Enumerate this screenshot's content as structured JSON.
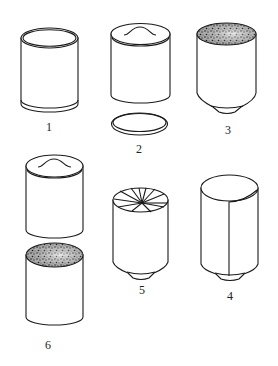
{
  "diagram": {
    "items": [
      {
        "id": 1,
        "label": "1",
        "kind": "open cylinder with rims"
      },
      {
        "id": 2,
        "label": "2",
        "kind": "cylinder with wavy-line top and separate lid disc"
      },
      {
        "id": 3,
        "label": "3",
        "kind": "cylinder with granular (speckled) top and conical base"
      },
      {
        "id": 4,
        "label": "4",
        "kind": "cylinder with vertical seam and conical base"
      },
      {
        "id": 5,
        "label": "5",
        "kind": "cylinder with pleated/radial top and conical base"
      },
      {
        "id": 6,
        "label": "6",
        "kind": "two stacked cylinders: wavy-line top above granular top"
      }
    ]
  },
  "colors": {
    "stroke": "#1a1a1a",
    "background": "#ffffff",
    "speckle": "#333333"
  }
}
